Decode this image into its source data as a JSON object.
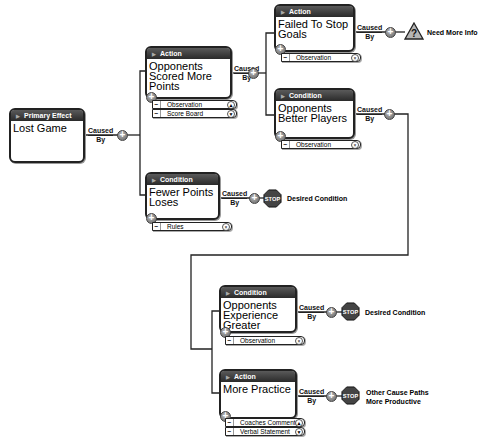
{
  "diagram": {
    "connector_label_top": "Caused",
    "connector_label_bottom": "By",
    "add_symbol": "+",
    "remove_symbol": "−",
    "nodes": [
      {
        "id": "n0",
        "type": "Primary Effect",
        "title": "Lost Game"
      },
      {
        "id": "n1",
        "type": "Action",
        "title": "Opponents Scored More Points",
        "evidence": [
          "Observation",
          "Score Board"
        ]
      },
      {
        "id": "n2",
        "type": "Action",
        "title": "Failed To Stop Goals",
        "evidence": [
          "Observation"
        ]
      },
      {
        "id": "n3",
        "type": "Condition",
        "title": "Opponents Better Players",
        "evidence": [
          "Observation"
        ]
      },
      {
        "id": "n4",
        "type": "Condition",
        "title": "Fewer Points Loses",
        "evidence": [
          "Rules"
        ]
      },
      {
        "id": "n5",
        "type": "Condition",
        "title": "Opponents Experience Greater",
        "evidence": [
          "Observation"
        ]
      },
      {
        "id": "n6",
        "type": "Action",
        "title": "More Practice",
        "evidence": [
          "Coaches Comment",
          "Verbal Statement"
        ]
      }
    ],
    "terminals": [
      {
        "from": "n2",
        "icon": "warning-question-icon",
        "glyph": "?",
        "text": "Need More Info"
      },
      {
        "from": "n4",
        "icon": "stop-sign-icon",
        "glyph": "STOP",
        "text": "Desired Condition"
      },
      {
        "from": "n5",
        "icon": "stop-sign-icon",
        "glyph": "STOP",
        "text": "Desired Condition"
      },
      {
        "from": "n6",
        "icon": "stop-sign-icon",
        "glyph": "STOP",
        "text": "Other Cause Paths More Productive"
      }
    ],
    "edges": [
      {
        "from": "n0",
        "to": [
          "n1",
          "n4"
        ]
      },
      {
        "from": "n1",
        "to": [
          "n2",
          "n3"
        ]
      },
      {
        "from": "n3",
        "to": [
          "n5",
          "n6"
        ]
      }
    ]
  }
}
